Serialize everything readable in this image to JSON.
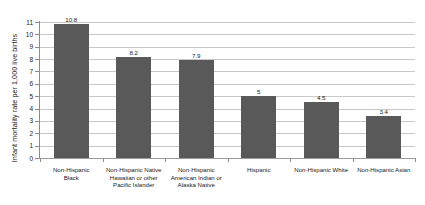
{
  "chart_data": {
    "type": "bar",
    "title": "",
    "subtitle": "",
    "xlabel": "",
    "ylabel": "Infant mortality rate per 1,000 live births",
    "ylim": [
      0,
      11
    ],
    "yticks": [
      0,
      1,
      2,
      3,
      4,
      5,
      6,
      7,
      8,
      9,
      10,
      11
    ],
    "ytick_labels": [
      "0",
      "1",
      "2",
      "3",
      "4",
      "5",
      "6",
      "7",
      "8",
      "9",
      "10",
      "11"
    ],
    "grid": true,
    "legend": "none",
    "bar_color": "#595959",
    "gridline_color": "#c8c8c8",
    "axis_color": "#8c8c8c",
    "categories": [
      "Non-Hispanic Black",
      "Non-Hispanic Native Hawaiian or other Pacific Islander",
      "Non-Hispanic American Indian or Alaska Native",
      "Hispanic",
      "Non-Hispanic White",
      "Non-Hispanic Asian"
    ],
    "category_lines": [
      [
        "Non-Hispanic",
        "Black"
      ],
      [
        "Non-Hispanic Native",
        "Hawaiian or other",
        "Pacific Islander"
      ],
      [
        "Non-Hispanic",
        "American Indian or",
        "Alaska Native"
      ],
      [
        "Hispanic"
      ],
      [
        "Non-Hispanic White"
      ],
      [
        "Non-Hispanic Asian"
      ]
    ],
    "values": [
      10.8,
      8.2,
      7.9,
      5,
      4.5,
      3.4
    ],
    "value_labels": [
      "10.8",
      "8.2",
      "7.9",
      "5",
      "4.5",
      "3.4"
    ]
  }
}
